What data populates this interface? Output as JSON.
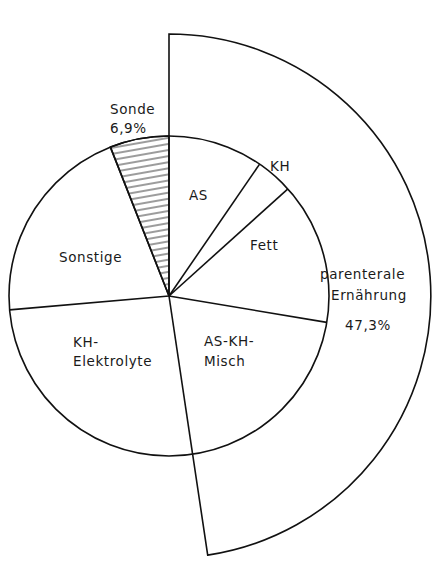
{
  "chart_data": {
    "type": "pie",
    "title": "",
    "center": [
      169,
      296
    ],
    "inner_radius": 160,
    "outer_radius": 262,
    "slices": [
      {
        "label": "AS",
        "start_deg": 0,
        "end_deg": 34.5,
        "group": "parenteral"
      },
      {
        "label": "KH",
        "start_deg": 34.5,
        "end_deg": 48,
        "group": "parenteral"
      },
      {
        "label": "Fett",
        "start_deg": 48,
        "end_deg": 99.5,
        "group": "parenteral"
      },
      {
        "label": "AS-KH-Misch",
        "start_deg": 99.5,
        "end_deg": 171.5,
        "group": "parenteral"
      },
      {
        "label": "KH-Elektrolyte",
        "start_deg": 171.5,
        "end_deg": 265,
        "group": ""
      },
      {
        "label": "Sonstige",
        "start_deg": 265,
        "end_deg": 338.5,
        "group": ""
      },
      {
        "label": "Sonde",
        "start_deg": 338.5,
        "end_deg": 360,
        "group": "",
        "hatched": true,
        "value_label": "6,9%"
      }
    ],
    "outer_group": {
      "label_line1": "parenterale",
      "label_line2": "Ernährung",
      "value_label": "47,3%",
      "start_deg": 0,
      "end_deg": 171.5
    },
    "values_percent": {
      "Sonde": 6.9,
      "parenterale Ernährung": 47.3
    }
  },
  "labels": {
    "sonde": "Sonde",
    "sonde_value": "6,9%",
    "as": "AS",
    "kh": "KH",
    "fett": "Fett",
    "as_kh_misch_1": "AS-KH-",
    "as_kh_misch_2": "Misch",
    "kh_elektrolyte_1": "KH-",
    "kh_elektrolyte_2": "Elektrolyte",
    "sonstige": "Sonstige",
    "parenteral_1": "parenterale",
    "parenteral_2": "Ernährung",
    "parenteral_value": "47,3%"
  }
}
